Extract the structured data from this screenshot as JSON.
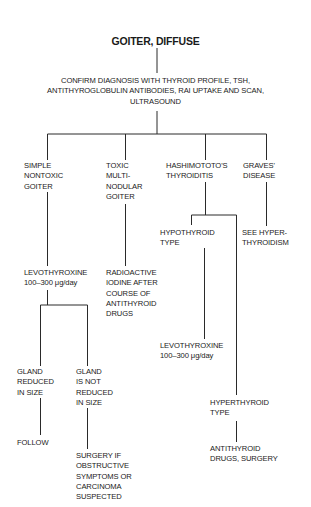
{
  "title": "GOITER, DIFFUSE",
  "confirm": {
    "lines": [
      "CONFIRM DIAGNOSIS WITH THYROID PROFILE, TSH,",
      "ANTITHYROGLOBULIN ANTIBODIES, RAI UPTAKE AND SCAN,",
      "ULTRASOUND"
    ]
  },
  "branches": {
    "simple": {
      "lines": [
        "SIMPLE",
        "NONTOXIC",
        "GOITER"
      ],
      "treatment": [
        "LEVOTHYROXINE",
        "100–300 μg/day"
      ],
      "reduced": {
        "lines": [
          "GLAND",
          "REDUCED",
          "IN SIZE"
        ],
        "action": [
          "FOLLOW"
        ]
      },
      "not_reduced": {
        "lines": [
          "GLAND",
          "IS NOT",
          "REDUCED",
          "IN SIZE"
        ],
        "action": [
          "SURGERY IF",
          "OBSTRUCTIVE",
          "SYMPTOMS OR",
          "CARCINOMA",
          "SUSPECTED"
        ]
      }
    },
    "toxic": {
      "lines": [
        "TOXIC",
        "MULTI-",
        "NODULAR",
        "GOITER"
      ],
      "treatment": [
        "RADIOACTIVE",
        "IODINE AFTER",
        "COURSE OF",
        "ANTITHYROID",
        "DRUGS"
      ]
    },
    "hashimoto": {
      "lines": [
        "HASHIMOTOTO'S",
        "THYROIDITIS"
      ],
      "hypo": {
        "lines": [
          "HYPOTHYROID",
          "TYPE"
        ],
        "treatment": [
          "LEVOTHYROXINE",
          "100–300 μg/day"
        ]
      },
      "hyper": {
        "lines": [
          "HYPERTHYROID",
          "TYPE"
        ],
        "treatment": [
          "ANTITHYROID",
          "DRUGS, SURGERY"
        ]
      }
    },
    "graves": {
      "lines": [
        "GRAVES'",
        "DISEASE"
      ],
      "treatment": [
        "SEE HYPER-",
        "THYROIDISM"
      ]
    }
  }
}
